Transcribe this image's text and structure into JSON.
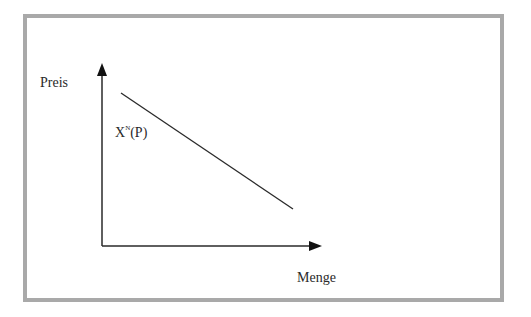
{
  "diagram": {
    "type": "demand-curve",
    "y_axis": {
      "label": "Preis"
    },
    "x_axis": {
      "label": "Menge"
    },
    "curve": {
      "name": "X",
      "superscript": "N",
      "argument": "(P)",
      "slope": "negative"
    },
    "colors": {
      "frame_border": "#a9a9a9",
      "axis": "#2a2a2a",
      "curve": "#2a2a2a",
      "background": "#ffffff"
    }
  },
  "geometry": {
    "origin": [
      102,
      246
    ],
    "y_axis_tip": [
      102,
      63
    ],
    "x_axis_tip": [
      322,
      246
    ],
    "curve_start": [
      121,
      93
    ],
    "curve_end": [
      293,
      209
    ]
  }
}
